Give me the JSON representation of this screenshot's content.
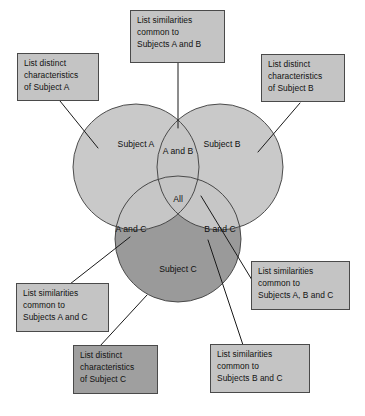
{
  "diagram": {
    "type": "three-set-venn-diagram",
    "background_color": "#ffffff",
    "circle_fill_light": "#c9c9c9",
    "circle_fill_dark": "#9a9a9a",
    "circle_stroke": "#3c3c3c",
    "callout_fill": "#c4c4c4",
    "callout_fill_dark": "#9f9f9f",
    "callout_stroke": "#4a4a4a",
    "leader_line_color": "#1a1a1a"
  },
  "regions": {
    "subject_a": "Subject A",
    "subject_b": "Subject B",
    "subject_c": "Subject C",
    "a_and_b": "A and B",
    "a_and_c": "A and C",
    "b_and_c": "B and C",
    "all": "All"
  },
  "callouts": [
    {
      "id": "distinct-a",
      "text": "List distinct\ncharacteristics\nof Subject A",
      "shade": "light"
    },
    {
      "id": "similar-ab",
      "text": "List similarities\ncommon to\nSubjects A and B",
      "shade": "light"
    },
    {
      "id": "distinct-b",
      "text": "List distinct\ncharacteristics\nof Subject B",
      "shade": "light"
    },
    {
      "id": "similar-ac",
      "text": "List similarities\ncommon to\nSubjects A and C",
      "shade": "light"
    },
    {
      "id": "similar-abc",
      "text": "List similarities\ncommon to\nSubjects A, B and C",
      "shade": "light"
    },
    {
      "id": "distinct-c",
      "text": "List distinct\ncharacteristics\nof Subject C",
      "shade": "dark"
    },
    {
      "id": "similar-bc",
      "text": "List similarities\ncommon to\nSubjects B and C",
      "shade": "light"
    }
  ]
}
